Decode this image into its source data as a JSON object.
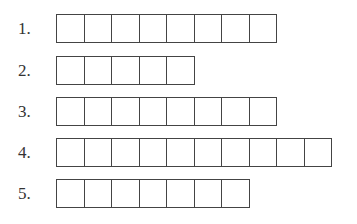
{
  "rows": [
    {
      "label": "1.",
      "cells": 8,
      "top": 14
    },
    {
      "label": "2.",
      "cells": 5,
      "top": 56
    },
    {
      "label": "3.",
      "cells": 8,
      "top": 97
    },
    {
      "label": "4.",
      "cells": 10,
      "top": 138
    },
    {
      "label": "5.",
      "cells": 7,
      "top": 179
    }
  ]
}
